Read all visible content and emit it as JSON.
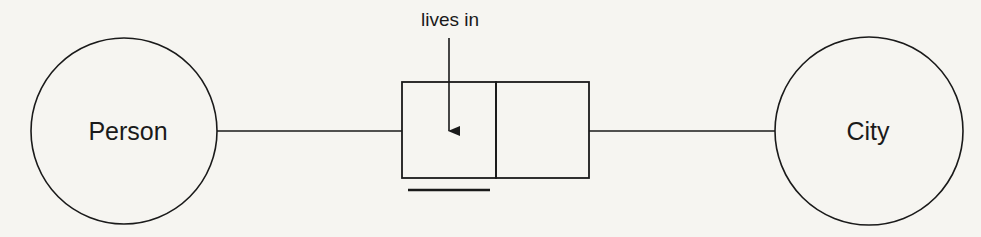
{
  "diagram": {
    "type": "ORM fact type diagram",
    "background_color": "#f6f5f1",
    "stroke_color": "#1a1a1a",
    "entities": [
      {
        "id": "person",
        "label": "Person",
        "cx": 124,
        "cy": 131,
        "r": 93
      },
      {
        "id": "city",
        "label": "City",
        "cx": 869,
        "cy": 131,
        "r": 94
      }
    ],
    "fact_type": {
      "predicate_label": "lives in",
      "roles": [
        {
          "id": "role-1",
          "x": 402,
          "y": 82,
          "width": 94,
          "height": 96
        },
        {
          "id": "role-2",
          "x": 496,
          "y": 82,
          "width": 93,
          "height": 96
        }
      ],
      "uniqueness_constraint": {
        "x1": 408,
        "x2": 490,
        "y": 190
      },
      "arrow": {
        "x": 449,
        "y1": 38,
        "y2": 131
      }
    },
    "connectors": [
      {
        "from": "person",
        "to": "role-1",
        "x1": 217,
        "x2": 402,
        "y": 131
      },
      {
        "from": "role-2",
        "to": "city",
        "x1": 589,
        "x2": 775,
        "y": 131
      }
    ]
  }
}
